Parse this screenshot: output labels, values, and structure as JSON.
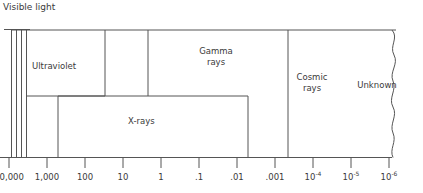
{
  "chart_data": {
    "type": "diagram",
    "title": "",
    "xlabel": "",
    "ylabel": "",
    "grid": false,
    "legend": "none",
    "axis": {
      "scale": "logarithmic",
      "direction": "decreasing",
      "tick_labels": [
        "10,000",
        "1,000",
        "100",
        "10",
        "1",
        ".1",
        ".01",
        ".001",
        "10-4",
        "10-5",
        "10-6"
      ],
      "tick_values": [
        10000,
        1000,
        100,
        10,
        1,
        0.1,
        0.01,
        0.001,
        0.0001,
        1e-05,
        1e-06
      ]
    },
    "regions": [
      {
        "name": "visible-light",
        "label": "Visible light",
        "start": 10000,
        "end": 4000
      },
      {
        "name": "ultraviolet",
        "label": "Ultraviolet",
        "start": 4000,
        "end": 100
      },
      {
        "name": "x-rays",
        "label": "X-rays",
        "start": 1000,
        "end": 0.01
      },
      {
        "name": "gamma-rays",
        "label": "Gamma rays",
        "start": 10,
        "end": 0.001
      },
      {
        "name": "cosmic-rays",
        "label": "Cosmic rays",
        "start": 0.001,
        "end": 1e-05
      },
      {
        "name": "unknown",
        "label": "Unknown",
        "start": 1e-05,
        "end": 1e-06
      }
    ]
  },
  "labels": {
    "visible_light": "Visible light",
    "ultraviolet": "Ultraviolet",
    "x_rays": "X-rays",
    "gamma_line1": "Gamma",
    "gamma_line2": "rays",
    "cosmic_line1": "Cosmic",
    "cosmic_line2": "rays",
    "unknown": "Unknown"
  },
  "axis_ticks": [
    {
      "text": "10,000",
      "sup": ""
    },
    {
      "text": "1,000",
      "sup": ""
    },
    {
      "text": "100",
      "sup": ""
    },
    {
      "text": "10",
      "sup": ""
    },
    {
      "text": "1",
      "sup": ""
    },
    {
      "text": ".1",
      "sup": ""
    },
    {
      "text": ".01",
      "sup": ""
    },
    {
      "text": ".001",
      "sup": ""
    },
    {
      "text": "10",
      "sup": "-4"
    },
    {
      "text": "10",
      "sup": "-5"
    },
    {
      "text": "10",
      "sup": "-6"
    }
  ],
  "colors": {
    "stroke": "#555555",
    "text": "#3a3a3a",
    "background": "#ffffff"
  }
}
